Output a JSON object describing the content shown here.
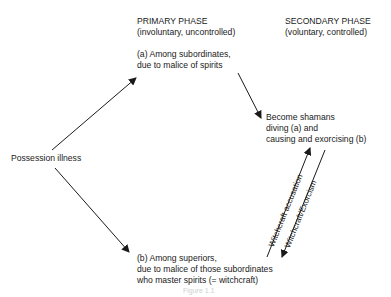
{
  "primary_phase": {
    "title": "PRIMARY PHASE",
    "subtitle": "(involuntary, uncontrolled)",
    "a_line1": "(a) Among subordinates,",
    "a_line2": "due to malice of spirits",
    "b_line1": "(b) Among superiors,",
    "b_line2": "due to malice of those subordinates",
    "b_line3": "who master spirits (= witchcraft)"
  },
  "secondary_phase": {
    "title": "SECONDARY PHASE",
    "subtitle": "(voluntary, controlled)",
    "outcome_line1": "Become shamans",
    "outcome_line2": "diving (a) and",
    "outcome_line3": "causing and exorcising (b)"
  },
  "origin": {
    "label": "Possession illness"
  },
  "edges": {
    "up_label": "Witchcraft accusation",
    "down_label": "Witchcraft/Exorcism"
  },
  "caption": "Figure 1.1"
}
